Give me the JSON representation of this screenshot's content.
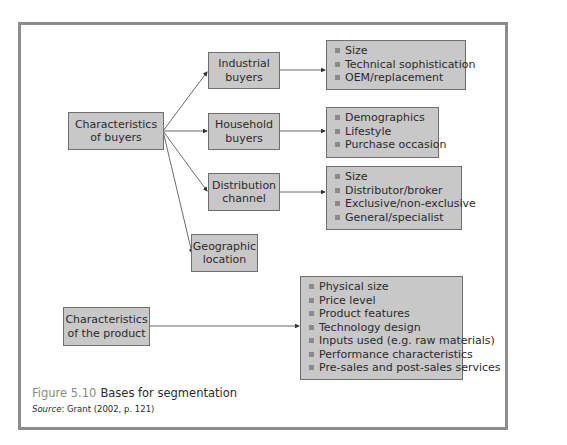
{
  "figure": {
    "number": "Figure 5.10",
    "title": "Bases for segmentation",
    "source_label": "Source",
    "source_text": ": Grant (2002, p. 121)"
  },
  "nodes": {
    "buyers": {
      "label": "Characteristics of buyers"
    },
    "industrial": {
      "label": "Industrial buyers"
    },
    "household": {
      "label": "Household buyers"
    },
    "distribution": {
      "label": "Distribution channel"
    },
    "geographic": {
      "label": "Geographic location"
    },
    "product": {
      "label": "Characteristics of the product"
    }
  },
  "lists": {
    "industrial": [
      "Size",
      "Technical sophistication",
      "OEM/replacement"
    ],
    "household": [
      "Demographics",
      "Lifestyle",
      "Purchase occasion"
    ],
    "distribution": [
      "Size",
      "Distributor/broker",
      "Exclusive/non-exclusive",
      "General/specialist"
    ],
    "product": [
      "Physical size",
      "Price level",
      "Product features",
      "Technology design",
      "Inputs used (e.g. raw materials)",
      "Performance characteristics",
      "Pre-sales and post-sales services"
    ]
  },
  "colors": {
    "box_fill": "#c8c8c8",
    "box_border": "#6e6e6e",
    "frame_border": "#8c8c8c",
    "bullet": "#8a8a8a"
  }
}
